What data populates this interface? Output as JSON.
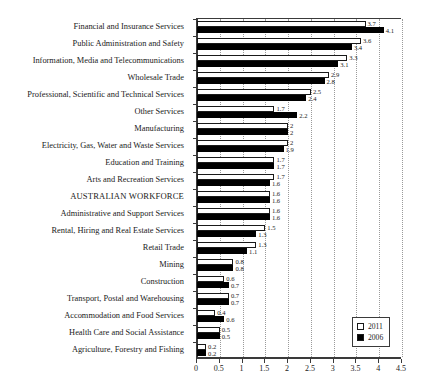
{
  "chart_data": {
    "type": "bar",
    "orientation": "horizontal",
    "title": "",
    "xlabel": "",
    "ylabel": "",
    "xlim": [
      0,
      4.5
    ],
    "xticks": [
      "0",
      "0.5",
      "1",
      "1.5",
      "2",
      "2.5",
      "3",
      "3.5",
      "4",
      "4.5"
    ],
    "xtick_values": [
      0,
      0.5,
      1,
      1.5,
      2,
      2.5,
      3,
      3.5,
      4,
      4.5
    ],
    "grid": "vertical dotted",
    "legend_position": "bottom-right",
    "categories": [
      "Financial and Insurance Services",
      "Public Administration and Safety",
      "Information, Media and Telecommunications",
      "Wholesale Trade",
      "Professional, Scientific and Technical Services",
      "Other Services",
      "Manufacturing",
      "Electricity, Gas, Water and Waste Services",
      "Education and Training",
      "Arts and Recreation Services",
      "AUSTRALIAN WORKFORCE",
      "Administrative and Support Services",
      "Rental, Hiring and Real Estate Services",
      "Retail Trade",
      "Mining",
      "Construction",
      "Transport, Postal and Warehousing",
      "Accommodation and Food Services",
      "Health Care and Social Assistance",
      "Agriculture, Forestry and Fishing"
    ],
    "series": [
      {
        "name": "2011",
        "color": "#ffffff",
        "values": [
          3.7,
          3.6,
          3.3,
          2.9,
          2.5,
          1.7,
          2.0,
          2.0,
          1.7,
          1.7,
          1.6,
          1.6,
          1.5,
          1.3,
          0.8,
          0.6,
          0.7,
          0.4,
          0.5,
          0.2
        ],
        "labels": [
          "3.7",
          "3.6",
          "3.3",
          "2.9",
          "2.5",
          "1.7",
          "2",
          "2",
          "1.7",
          "1.7",
          "1.6",
          "1.6",
          "1.5",
          "1.3",
          "0.8",
          "0.6",
          "0.7",
          "0.4",
          "0.5",
          "0.2"
        ]
      },
      {
        "name": "2006",
        "color": "#000000",
        "values": [
          4.1,
          3.4,
          3.1,
          2.8,
          2.4,
          2.2,
          2.0,
          1.9,
          1.7,
          1.6,
          1.6,
          1.6,
          1.3,
          1.1,
          0.8,
          0.7,
          0.7,
          0.6,
          0.5,
          0.2
        ],
        "labels": [
          "4.1",
          "3.4",
          "3.1",
          "2.8",
          "2.4",
          "2.2",
          "2",
          "1.9",
          "1.7",
          "1.6",
          "1.6",
          "1.6",
          "1.3",
          "1.1",
          "0.8",
          "0.7",
          "0.7",
          "0.6",
          "0.5",
          "0.2"
        ]
      }
    ]
  },
  "legend": {
    "items": [
      {
        "label": "2011",
        "swatch": "white-square"
      },
      {
        "label": "2006",
        "swatch": "black-square"
      }
    ]
  }
}
